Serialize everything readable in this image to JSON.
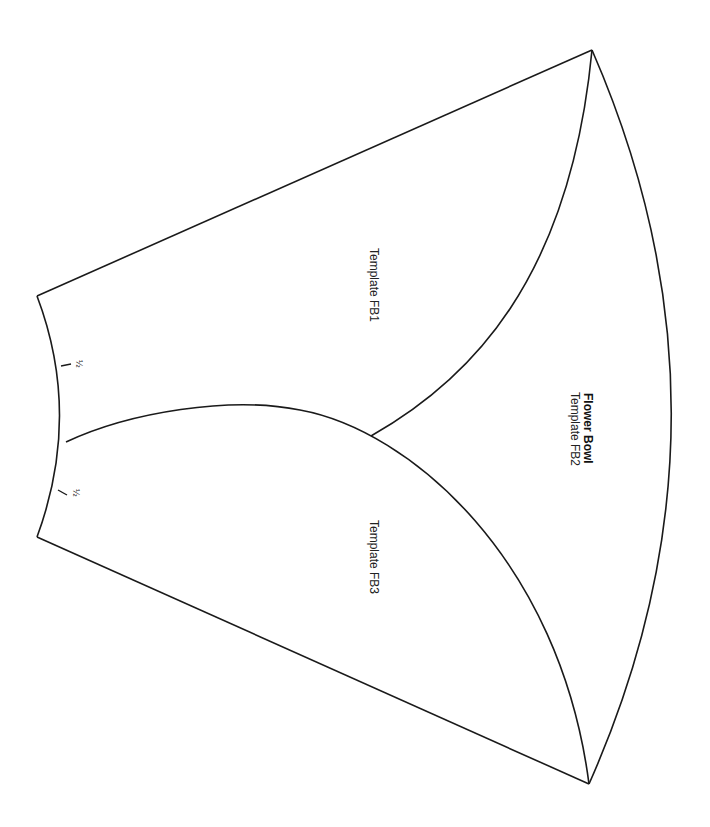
{
  "diagram": {
    "title": "Flower Bowl",
    "orientation": "rotated 90deg clockwise",
    "pieces": [
      {
        "id": "FB1",
        "label": "Template FB1"
      },
      {
        "id": "FB2",
        "label": "Template FB2"
      },
      {
        "id": "FB3",
        "label": "Template FB3"
      }
    ],
    "marks": [
      {
        "label": "½"
      },
      {
        "label": "½"
      }
    ],
    "colors": {
      "line": "#1a1a1a",
      "text": "#222222",
      "background": "#ffffff"
    }
  }
}
